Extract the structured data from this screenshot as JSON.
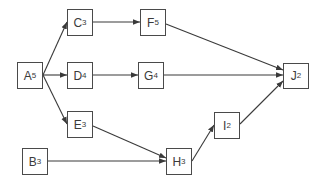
{
  "diagram": {
    "type": "activity-network",
    "colors": {
      "line": "#3a3a3a",
      "box_border": "#4a4a4a",
      "text": "#3a3a3a",
      "background": "#ffffff"
    },
    "nodes": [
      {
        "id": "A",
        "letter": "A",
        "duration": "5",
        "x": 17,
        "y": 62,
        "w": 26,
        "h": 27
      },
      {
        "id": "B",
        "letter": "B",
        "duration": "3",
        "x": 22,
        "y": 148,
        "w": 26,
        "h": 27
      },
      {
        "id": "C",
        "letter": "C",
        "duration": "3",
        "x": 67,
        "y": 9,
        "w": 26,
        "h": 27
      },
      {
        "id": "D",
        "letter": "D",
        "duration": "4",
        "x": 67,
        "y": 62,
        "w": 26,
        "h": 27
      },
      {
        "id": "E",
        "letter": "E",
        "duration": "3",
        "x": 67,
        "y": 111,
        "w": 26,
        "h": 27
      },
      {
        "id": "F",
        "letter": "F",
        "duration": "5",
        "x": 140,
        "y": 9,
        "w": 26,
        "h": 27
      },
      {
        "id": "G",
        "letter": "G",
        "duration": "4",
        "x": 138,
        "y": 62,
        "w": 26,
        "h": 27
      },
      {
        "id": "H",
        "letter": "H",
        "duration": "3",
        "x": 166,
        "y": 148,
        "w": 26,
        "h": 27
      },
      {
        "id": "I",
        "letter": "I",
        "duration": "2",
        "x": 214,
        "y": 112,
        "w": 26,
        "h": 27
      },
      {
        "id": "J",
        "letter": "J",
        "duration": "2",
        "x": 283,
        "y": 63,
        "w": 26,
        "h": 26
      }
    ],
    "edges": [
      {
        "from": "A",
        "to": "C",
        "x1": 43,
        "y1": 75,
        "x2": 67,
        "y2": 22
      },
      {
        "from": "A",
        "to": "D",
        "x1": 43,
        "y1": 75,
        "x2": 67,
        "y2": 75
      },
      {
        "from": "A",
        "to": "E",
        "x1": 43,
        "y1": 75,
        "x2": 67,
        "y2": 124
      },
      {
        "from": "C",
        "to": "F",
        "x1": 93,
        "y1": 22,
        "x2": 140,
        "y2": 22
      },
      {
        "from": "D",
        "to": "G",
        "x1": 93,
        "y1": 75,
        "x2": 138,
        "y2": 75
      },
      {
        "from": "F",
        "to": "J",
        "x1": 166,
        "y1": 24,
        "x2": 283,
        "y2": 70
      },
      {
        "from": "G",
        "to": "J",
        "x1": 164,
        "y1": 75,
        "x2": 283,
        "y2": 75
      },
      {
        "from": "E",
        "to": "H",
        "x1": 93,
        "y1": 126,
        "x2": 166,
        "y2": 158
      },
      {
        "from": "B",
        "to": "H",
        "x1": 48,
        "y1": 161,
        "x2": 166,
        "y2": 161
      },
      {
        "from": "H",
        "to": "I",
        "x1": 192,
        "y1": 161,
        "x2": 214,
        "y2": 125
      },
      {
        "from": "I",
        "to": "J",
        "x1": 240,
        "y1": 124,
        "x2": 283,
        "y2": 81
      }
    ]
  }
}
